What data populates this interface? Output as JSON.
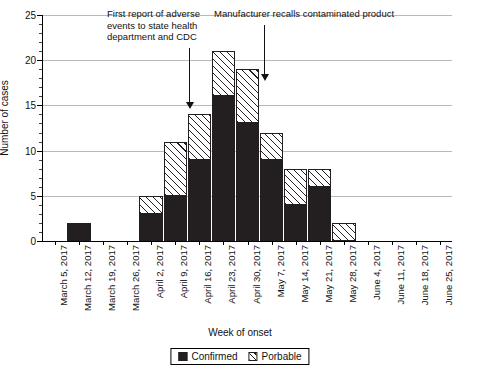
{
  "chart_data": {
    "type": "bar",
    "title": "",
    "xlabel": "Week of onset",
    "ylabel": "Number of cases",
    "ylim": [
      0,
      25
    ],
    "ytick_step": 5,
    "yticks": [
      0,
      5,
      10,
      15,
      20,
      25
    ],
    "grid": true,
    "stacked": true,
    "legend_position": "bottom-center",
    "categories": [
      "March 5, 2017",
      "March 12, 2017",
      "March 19, 2017",
      "March 26, 2017",
      "April 2, 2017",
      "April 9, 2017",
      "April 16, 2017",
      "April 23, 2017",
      "April 30, 2017",
      "May 7, 2017",
      "May 14, 2017",
      "May 21, 2017",
      "May 28, 2017",
      "June 4, 2017",
      "June 11, 2017",
      "June 18, 2017",
      "June 25, 2017"
    ],
    "series": [
      {
        "name": "Confirmed",
        "values": [
          0,
          2,
          0,
          0,
          3,
          5,
          9,
          16,
          13,
          9,
          4,
          6,
          0,
          0,
          0,
          0,
          0
        ]
      },
      {
        "name": "Porbable",
        "values": [
          0,
          0,
          0,
          0,
          2,
          6,
          5,
          5,
          6,
          3,
          4,
          2,
          2,
          0,
          0,
          0,
          0
        ]
      }
    ],
    "totals": [
      0,
      2,
      0,
      0,
      5,
      11,
      14,
      21,
      19,
      12,
      8,
      8,
      2,
      0,
      0,
      0,
      0
    ],
    "annotations": [
      {
        "text": "First report of adverse events to state health department and CDC",
        "points_to": "April 16, 2017",
        "arrow_tip_value": 14
      },
      {
        "text": "Manufacturer recalls contaminated product",
        "points_to": "April 30, 2017",
        "arrow_tip_value": 19
      }
    ]
  },
  "legend": {
    "items": [
      {
        "label": "Confirmed",
        "pattern": "solid-black",
        "color": "#231f20"
      },
      {
        "label": "Porbable",
        "pattern": "diagonal-hatch",
        "color": "#231f20"
      }
    ]
  },
  "colors": {
    "confirmed": "#231f20",
    "probable_hatch": "#231f20",
    "gridline": "#b9b9b9",
    "axis": "#000000",
    "background": "#ffffff"
  }
}
